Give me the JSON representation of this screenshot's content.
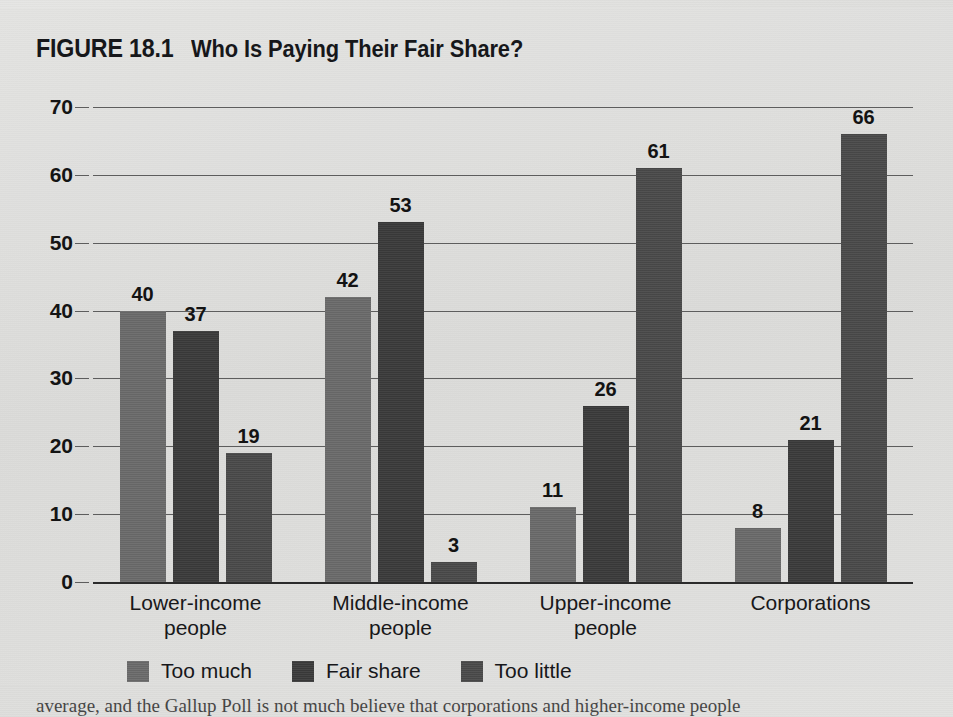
{
  "figure": {
    "number_label": "FIGURE 18.1",
    "title": "Who Is Paying Their Fair Share?"
  },
  "caption_partial": "average, and the Gallup Poll is not much believe that corporations and higher-income people",
  "colors": {
    "panel_background": "#e0e0de",
    "page_background": "#dedede",
    "series_too_much": "#6b6b6b",
    "series_fair_share": "#3b3b3b",
    "series_too_little": "#4a4a4a",
    "gridline": "#5d5d5d",
    "axis": "#2b2b2b",
    "text": "#141414"
  },
  "chart_data": {
    "type": "bar",
    "title": "Who Is Paying Their Fair Share?",
    "xlabel": "",
    "ylabel": "",
    "ylim": [
      0,
      70
    ],
    "yticks": [
      "0",
      "10",
      "20",
      "30",
      "40",
      "50",
      "60",
      "70"
    ],
    "grid": true,
    "legend_position": "bottom",
    "categories": [
      "Lower-income\npeople",
      "Middle-income\npeople",
      "Upper-income\npeople",
      "Corporations"
    ],
    "category_lines": [
      [
        "Lower-income",
        "people"
      ],
      [
        "Middle-income",
        "people"
      ],
      [
        "Upper-income",
        "people"
      ],
      [
        "Corporations",
        ""
      ]
    ],
    "series": [
      {
        "name": "Too much",
        "color": "#6b6b6b",
        "values": [
          40,
          42,
          11,
          8
        ]
      },
      {
        "name": "Fair share",
        "color": "#3b3b3b",
        "values": [
          37,
          53,
          26,
          21
        ]
      },
      {
        "name": "Too little",
        "color": "#4a4a4a",
        "values": [
          19,
          3,
          61,
          66
        ]
      }
    ]
  }
}
